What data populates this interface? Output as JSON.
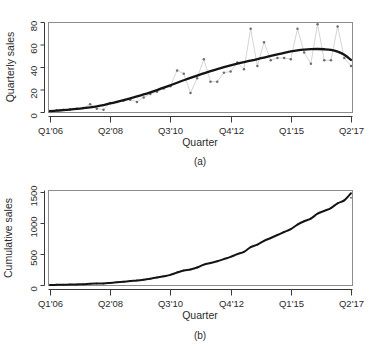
{
  "figure": {
    "caption_a": "(a)",
    "caption_b": "(b)"
  },
  "chart_data": [
    {
      "type": "scatter",
      "panel": "a",
      "title": "",
      "caption": "(a)",
      "xlabel": "Quarter",
      "ylabel": "Quarterly sales",
      "ylim": [
        0,
        80
      ],
      "yticks": [
        0,
        20,
        40,
        60,
        80
      ],
      "ytick_labels": [
        "0",
        "20",
        "40",
        "60",
        "80"
      ],
      "xtick_labels": [
        "Q1'06",
        "Q2'08",
        "Q3'10",
        "Q4'12",
        "Q1'15",
        "Q2'17"
      ],
      "xtick_indices": [
        0,
        9,
        18,
        27,
        36,
        45
      ],
      "grid": false,
      "legend": "none",
      "x": [
        "Q1'06",
        "Q2'06",
        "Q3'06",
        "Q4'06",
        "Q1'07",
        "Q2'07",
        "Q3'07",
        "Q4'07",
        "Q1'08",
        "Q2'08",
        "Q3'08",
        "Q4'08",
        "Q1'09",
        "Q2'09",
        "Q3'09",
        "Q4'09",
        "Q1'10",
        "Q2'10",
        "Q3'10",
        "Q4'10",
        "Q1'11",
        "Q2'11",
        "Q3'11",
        "Q4'11",
        "Q1'12",
        "Q2'12",
        "Q3'12",
        "Q4'12",
        "Q1'13",
        "Q2'13",
        "Q3'13",
        "Q4'13",
        "Q1'14",
        "Q2'14",
        "Q3'14",
        "Q4'14",
        "Q1'15",
        "Q2'15",
        "Q3'15",
        "Q4'15",
        "Q1'16",
        "Q2'16",
        "Q3'16",
        "Q4'16",
        "Q1'17",
        "Q2'17"
      ],
      "series": [
        {
          "name": "Quarterly sales (observed)",
          "style": "points",
          "values": [
            1,
            1.5,
            2,
            2.5,
            3,
            3.5,
            7,
            3,
            2,
            8,
            9,
            10,
            11,
            9,
            13,
            16,
            18,
            21,
            23,
            37,
            34,
            17,
            30,
            47,
            27,
            27,
            35,
            36,
            44,
            38,
            74,
            41,
            62,
            46,
            48,
            48,
            47,
            74,
            53,
            43,
            78,
            46,
            46,
            76,
            48,
            41
          ]
        },
        {
          "name": "Fitted trend (smooth)",
          "style": "line",
          "values": [
            0.8,
            1.2,
            1.6,
            2.1,
            2.7,
            3.4,
            4.2,
            5.1,
            6.2,
            7.6,
            9.0,
            10.5,
            12.1,
            13.8,
            15.6,
            17.5,
            19.5,
            21.6,
            23.8,
            26.0,
            28.2,
            30.3,
            32.4,
            34.4,
            36.3,
            38.1,
            39.8,
            41.4,
            42.9,
            44.3,
            45.6,
            47.0,
            48.4,
            49.8,
            51.2,
            52.6,
            53.8,
            54.8,
            55.5,
            55.9,
            56.0,
            55.8,
            55.2,
            53.6,
            50.8,
            46.3
          ]
        }
      ]
    },
    {
      "type": "line",
      "panel": "b",
      "title": "",
      "caption": "(b)",
      "xlabel": "Quarter",
      "ylabel": "Cumulative sales",
      "ylim": [
        0,
        1500
      ],
      "yticks": [
        0,
        500,
        1000,
        1500
      ],
      "ytick_labels": [
        "0",
        "500",
        "1000",
        "1500"
      ],
      "xtick_labels": [
        "Q1'06",
        "Q2'08",
        "Q3'10",
        "Q4'12",
        "Q1'15",
        "Q2'17"
      ],
      "xtick_indices": [
        0,
        9,
        18,
        27,
        36,
        45
      ],
      "grid": false,
      "legend": "none",
      "x": [
        "Q1'06",
        "Q2'06",
        "Q3'06",
        "Q4'06",
        "Q1'07",
        "Q2'07",
        "Q3'07",
        "Q4'07",
        "Q1'08",
        "Q2'08",
        "Q3'08",
        "Q4'08",
        "Q1'09",
        "Q2'09",
        "Q3'09",
        "Q4'09",
        "Q1'10",
        "Q2'10",
        "Q3'10",
        "Q4'10",
        "Q1'11",
        "Q2'11",
        "Q3'11",
        "Q4'11",
        "Q1'12",
        "Q2'12",
        "Q3'12",
        "Q4'12",
        "Q1'13",
        "Q2'13",
        "Q3'13",
        "Q4'13",
        "Q1'14",
        "Q2'14",
        "Q3'14",
        "Q4'14",
        "Q1'15",
        "Q2'15",
        "Q3'15",
        "Q4'15",
        "Q1'16",
        "Q2'16",
        "Q3'16",
        "Q4'16",
        "Q1'17",
        "Q2'17"
      ],
      "series": [
        {
          "name": "Cumulative sales (observed)",
          "style": "points",
          "values": [
            1,
            2.5,
            4.5,
            7,
            10,
            13.5,
            20.5,
            23.5,
            25.5,
            33.5,
            42.5,
            52.5,
            63.5,
            72.5,
            85.5,
            101.5,
            119.5,
            140.5,
            163.5,
            200.5,
            234.5,
            251.5,
            281.5,
            328.5,
            355.5,
            382.5,
            417.5,
            453.5,
            497.5,
            535.5,
            609.5,
            650.5,
            712.5,
            758.5,
            806.5,
            854.5,
            901.5,
            975.5,
            1028.5,
            1071.5,
            1149.5,
            1195.5,
            1241.5,
            1317.5,
            1365.5,
            1406.5
          ]
        },
        {
          "name": "Cumulative fitted",
          "style": "line",
          "values": [
            1,
            2.5,
            4.5,
            7,
            10,
            13.5,
            20.5,
            23.5,
            25.5,
            33.5,
            42.5,
            52.5,
            63.5,
            72.5,
            85.5,
            101.5,
            119.5,
            140.5,
            163.5,
            200.5,
            234.5,
            251.5,
            281.5,
            328.5,
            355.5,
            382.5,
            417.5,
            453.5,
            497.5,
            535.5,
            609.5,
            650.5,
            712.5,
            758.5,
            806.5,
            854.5,
            901.5,
            975.5,
            1028.5,
            1071.5,
            1149.5,
            1195.5,
            1241.5,
            1317.5,
            1365.5,
            1480
          ]
        }
      ]
    }
  ]
}
